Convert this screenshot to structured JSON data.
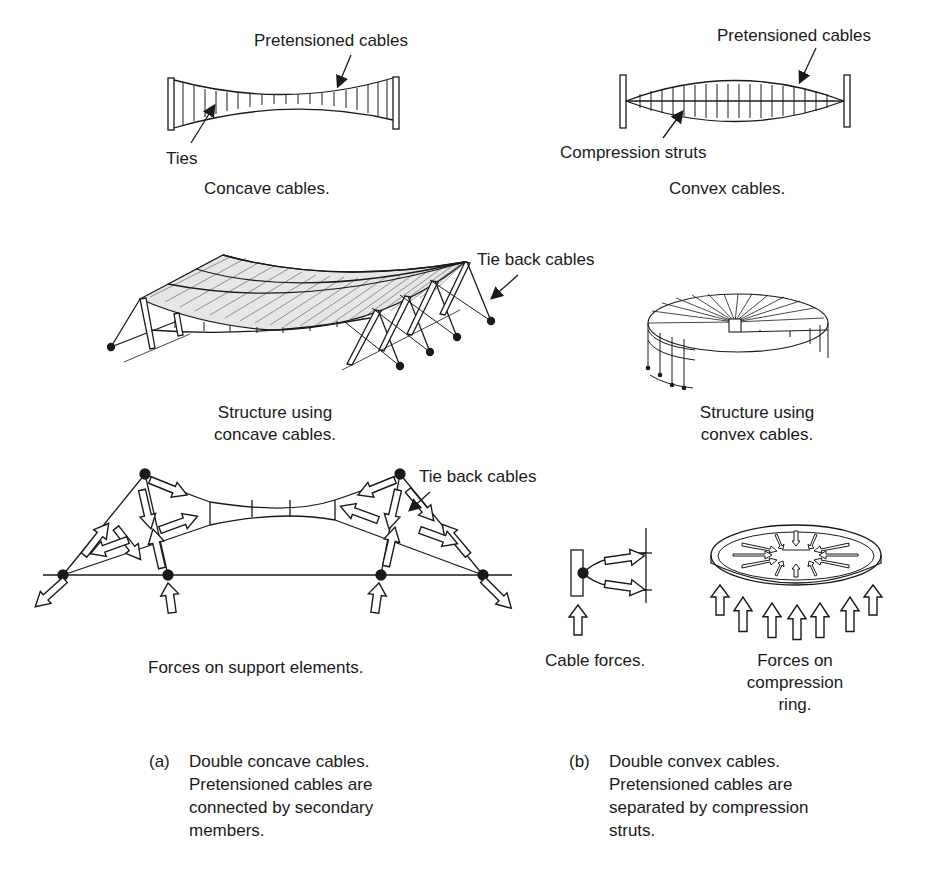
{
  "top_left": {
    "label_cables": "Pretensioned cables",
    "label_ties": "Ties",
    "caption": "Concave cables."
  },
  "top_right": {
    "label_cables": "Pretensioned cables",
    "label_struts": "Compression struts",
    "caption": "Convex cables."
  },
  "middle_left": {
    "label_tieback": "Tie back cables",
    "caption_line1": "Structure using",
    "caption_line2": "concave cables."
  },
  "middle_right": {
    "caption_line1": "Structure using",
    "caption_line2": "convex cables."
  },
  "bottom_left": {
    "label_tieback": "Tie back cables",
    "caption": "Forces on support elements."
  },
  "bottom_right": {
    "cable_forces_caption": "Cable forces.",
    "ring_caption_line1": "Forces on",
    "ring_caption_line2": "compression",
    "ring_caption_line3": "ring."
  },
  "notes": {
    "a": {
      "tag": "(a)",
      "lines": [
        "Double concave cables.",
        "Pretensioned cables are",
        "connected by secondary",
        "members."
      ]
    },
    "b": {
      "tag": "(b)",
      "lines": [
        "Double convex cables.",
        "Pretensioned cables are",
        "separated by compression",
        "struts."
      ]
    }
  },
  "colors": {
    "ink": "#1a1a1a",
    "background": "#ffffff"
  }
}
